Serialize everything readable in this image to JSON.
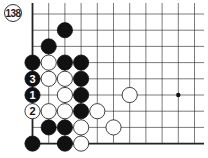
{
  "diagram": {
    "label": "138",
    "board": {
      "columns": 11,
      "rows": 9,
      "edges": [
        "left",
        "bottom"
      ],
      "star_points": [
        [
          9,
          5
        ]
      ]
    },
    "stones": [
      {
        "color": "black",
        "col": 2,
        "row": 1
      },
      {
        "color": "black",
        "col": 1,
        "row": 2
      },
      {
        "color": "black",
        "col": 0,
        "row": 3
      },
      {
        "color": "white",
        "col": 1,
        "row": 3
      },
      {
        "color": "black",
        "col": 2,
        "row": 3
      },
      {
        "color": "black",
        "col": 3,
        "row": 3
      },
      {
        "color": "black",
        "col": 0,
        "row": 4,
        "label": "3"
      },
      {
        "color": "white",
        "col": 1,
        "row": 4
      },
      {
        "color": "white",
        "col": 2,
        "row": 4
      },
      {
        "color": "black",
        "col": 3,
        "row": 4
      },
      {
        "color": "black",
        "col": 0,
        "row": 5,
        "label": "1"
      },
      {
        "color": "white",
        "col": 2,
        "row": 5
      },
      {
        "color": "black",
        "col": 3,
        "row": 5
      },
      {
        "color": "white",
        "col": 6,
        "row": 5
      },
      {
        "color": "white",
        "col": 0,
        "row": 6,
        "label": "2"
      },
      {
        "color": "white",
        "col": 1,
        "row": 6
      },
      {
        "color": "white",
        "col": 2,
        "row": 6
      },
      {
        "color": "black",
        "col": 3,
        "row": 6
      },
      {
        "color": "white",
        "col": 4,
        "row": 6
      },
      {
        "color": "black",
        "col": 1,
        "row": 7
      },
      {
        "color": "black",
        "col": 2,
        "row": 7
      },
      {
        "color": "white",
        "col": 3,
        "row": 7
      },
      {
        "color": "white",
        "col": 5,
        "row": 7
      },
      {
        "color": "black",
        "col": 0,
        "row": 8
      },
      {
        "color": "black",
        "col": 2,
        "row": 8
      },
      {
        "color": "white",
        "col": 3,
        "row": 8
      }
    ]
  }
}
